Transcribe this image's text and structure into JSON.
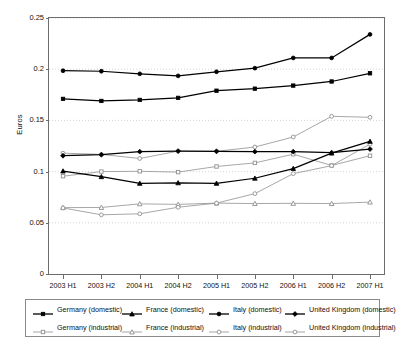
{
  "chart_data": {
    "type": "line",
    "title": "",
    "xlabel": "",
    "ylabel": "Euros",
    "categories": [
      "2003 H1",
      "2003 H2",
      "2004 H1",
      "2004 H2",
      "2005 H1",
      "2005 H2",
      "2006 H1",
      "2006 H2",
      "2007 H1"
    ],
    "ylim": [
      0,
      0.25
    ],
    "yticks": [
      0,
      0.05,
      0.1,
      0.15,
      0.2,
      0.25
    ],
    "ytick_labels": [
      "0",
      "0.05",
      "0.1",
      "0.15",
      "0.2",
      "0.25"
    ],
    "grid": "horizontal-dotted",
    "legend_position": "bottom",
    "series": [
      {
        "name": "Germany (domestic)",
        "marker": "filled-square",
        "color": "#000000",
        "values": [
          0.171,
          0.169,
          0.17,
          0.172,
          0.179,
          0.181,
          0.184,
          0.188,
          0.196
        ]
      },
      {
        "name": "France (domestic)",
        "marker": "filled-triangle",
        "color": "#000000",
        "values": [
          0.1005,
          0.095,
          0.0885,
          0.089,
          0.0885,
          0.0935,
          0.103,
          0.118,
          0.1295
        ]
      },
      {
        "name": "Italy (domestic)",
        "marker": "filled-circle",
        "color": "#000000",
        "values": [
          0.1985,
          0.198,
          0.1955,
          0.1935,
          0.1975,
          0.201,
          0.211,
          0.211,
          0.234
        ]
      },
      {
        "name": "United Kingdom (domestic)",
        "marker": "filled-diamond",
        "color": "#000000",
        "values": [
          0.1155,
          0.1165,
          0.1195,
          0.12,
          0.1198,
          0.1195,
          0.1195,
          0.1185,
          0.122
        ]
      },
      {
        "name": "Germany (industrial)",
        "marker": "open-square",
        "color": "#909090",
        "values": [
          0.0955,
          0.1,
          0.1003,
          0.0995,
          0.105,
          0.1085,
          0.117,
          0.106,
          0.1155
        ]
      },
      {
        "name": "France (industrial)",
        "marker": "open-triangle",
        "color": "#909090",
        "values": [
          0.0648,
          0.065,
          0.0685,
          0.068,
          0.0692,
          0.0688,
          0.069,
          0.0688,
          0.0702
        ]
      },
      {
        "name": "Italy (industrial)",
        "marker": "open-circle",
        "color": "#909090",
        "values": [
          0.0645,
          0.0578,
          0.0588,
          0.0652,
          0.0692,
          0.0785,
          0.098,
          0.1058,
          0.1268
        ]
      },
      {
        "name": "United Kingdom (industrial)",
        "marker": "open-circle",
        "color": "#909090",
        "values": [
          0.118,
          0.1168,
          0.1128,
          0.12,
          0.1198,
          0.124,
          0.1338,
          0.154,
          0.153
        ]
      }
    ]
  },
  "legend": {
    "rows": [
      [
        "Germany (domestic)",
        "France (domestic)",
        "Italy (domestic)",
        "United Kingdom (domestic)"
      ],
      [
        "Germany (industrial)",
        "France (industrial)",
        "Italy (industrial)",
        "United Kingdom (industrial)"
      ]
    ]
  }
}
